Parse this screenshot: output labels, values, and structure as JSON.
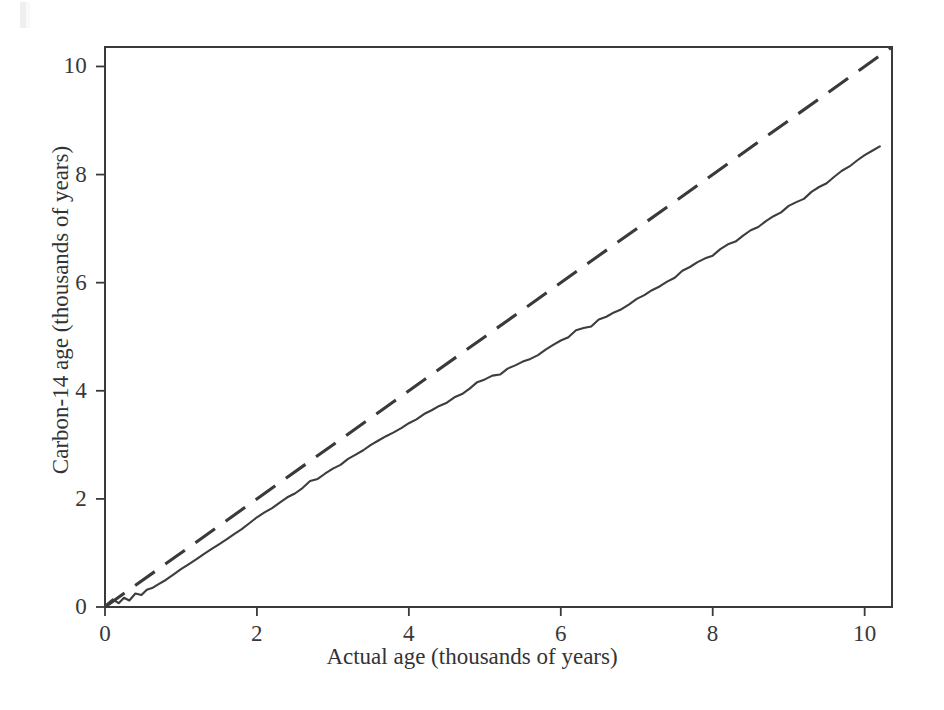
{
  "chart_data": {
    "type": "line",
    "title": "",
    "subtitle": "",
    "xlabel": "Actual age (thousands of years)",
    "ylabel": "Carbon-14 age (thousands of years)",
    "xlim": [
      0,
      10.36
    ],
    "ylim": [
      0,
      10.36
    ],
    "xticks": [
      0,
      2,
      4,
      6,
      8,
      10
    ],
    "yticks": [
      0,
      2,
      4,
      6,
      8,
      10
    ],
    "xtick_labels": [
      "0",
      "2",
      "4",
      "6",
      "8",
      "10"
    ],
    "ytick_labels": [
      "0",
      "2",
      "4",
      "6",
      "8",
      "10"
    ],
    "grid": false,
    "legend": "none",
    "axis_style": "L-shaped-box",
    "series": [
      {
        "name": "one-to-one reference line",
        "style": "dashed",
        "color": "#3a3a3a",
        "x": [
          0,
          10.36
        ],
        "values": [
          0,
          10.36
        ]
      },
      {
        "name": "Carbon-14 calibration curve",
        "style": "solid",
        "color": "#3d3d3d",
        "x": [
          0.0,
          0.1,
          0.18,
          0.25,
          0.32,
          0.4,
          0.48,
          0.55,
          0.62,
          0.7,
          0.8,
          0.9,
          1.0,
          1.1,
          1.2,
          1.3,
          1.4,
          1.5,
          1.6,
          1.7,
          1.8,
          1.9,
          2.0,
          2.1,
          2.2,
          2.3,
          2.4,
          2.5,
          2.6,
          2.7,
          2.8,
          2.9,
          3.0,
          3.1,
          3.2,
          3.3,
          3.4,
          3.5,
          3.6,
          3.7,
          3.8,
          3.9,
          4.0,
          4.1,
          4.2,
          4.3,
          4.4,
          4.5,
          4.6,
          4.7,
          4.8,
          4.9,
          5.0,
          5.1,
          5.2,
          5.3,
          5.4,
          5.5,
          5.6,
          5.7,
          5.8,
          5.9,
          6.0,
          6.1,
          6.2,
          6.3,
          6.4,
          6.5,
          6.6,
          6.7,
          6.8,
          6.9,
          7.0,
          7.1,
          7.2,
          7.3,
          7.4,
          7.5,
          7.6,
          7.7,
          7.8,
          7.9,
          8.0,
          8.1,
          8.2,
          8.3,
          8.4,
          8.5,
          8.6,
          8.7,
          8.8,
          8.9,
          9.0,
          9.1,
          9.2,
          9.3,
          9.4,
          9.5,
          9.6,
          9.7,
          9.8,
          9.9,
          10.0,
          10.1,
          10.2
        ],
        "values": [
          0.02,
          0.14,
          0.07,
          0.17,
          0.12,
          0.25,
          0.22,
          0.32,
          0.35,
          0.42,
          0.5,
          0.6,
          0.7,
          0.79,
          0.88,
          0.98,
          1.07,
          1.16,
          1.25,
          1.35,
          1.44,
          1.55,
          1.66,
          1.75,
          1.83,
          1.93,
          2.03,
          2.1,
          2.2,
          2.33,
          2.37,
          2.47,
          2.56,
          2.63,
          2.74,
          2.82,
          2.9,
          3.0,
          3.08,
          3.16,
          3.23,
          3.31,
          3.4,
          3.47,
          3.57,
          3.64,
          3.72,
          3.78,
          3.88,
          3.94,
          4.04,
          4.16,
          4.21,
          4.28,
          4.3,
          4.41,
          4.47,
          4.54,
          4.59,
          4.66,
          4.76,
          4.85,
          4.93,
          4.99,
          5.12,
          5.16,
          5.19,
          5.32,
          5.37,
          5.45,
          5.51,
          5.6,
          5.7,
          5.77,
          5.86,
          5.93,
          6.02,
          6.09,
          6.22,
          6.29,
          6.38,
          6.45,
          6.5,
          6.62,
          6.71,
          6.76,
          6.87,
          6.97,
          7.03,
          7.14,
          7.23,
          7.3,
          7.42,
          7.49,
          7.55,
          7.68,
          7.77,
          7.84,
          7.96,
          8.07,
          8.15,
          8.26,
          8.36,
          8.44,
          8.52
        ]
      }
    ]
  },
  "axes": {
    "x_title": "Actual age (thousands of years)",
    "y_title": "Carbon-14 age (thousands of years)"
  },
  "ticks": {
    "x": [
      "0",
      "2",
      "4",
      "6",
      "8",
      "10"
    ],
    "y": [
      "0",
      "2",
      "4",
      "6",
      "8",
      "10"
    ]
  },
  "colors": {
    "ink": "#3a3a3a",
    "background": "#ffffff",
    "curve": "#3d3d3d"
  }
}
